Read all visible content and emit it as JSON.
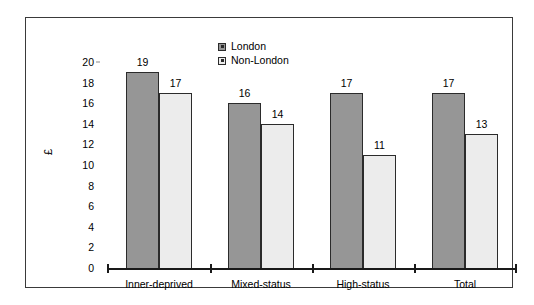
{
  "chart_data": {
    "type": "bar",
    "title": "",
    "xlabel": "",
    "ylabel": "£",
    "categories": [
      "Inner-deprived",
      "Mixed-status",
      "High-status",
      "Total"
    ],
    "series": [
      {
        "name": "London",
        "values": [
          19,
          16,
          17,
          17
        ],
        "color": "#969696"
      },
      {
        "name": "Non-London",
        "values": [
          17,
          14,
          11,
          13
        ],
        "color": "#ececec"
      }
    ],
    "ylim": [
      0,
      20
    ],
    "yticks": [
      0,
      2,
      4,
      6,
      8,
      10,
      12,
      14,
      16,
      18,
      20
    ],
    "grid": false,
    "legend_position": "top-center"
  },
  "legend": {
    "items": [
      {
        "label": "London"
      },
      {
        "label": "Non-London"
      }
    ]
  }
}
